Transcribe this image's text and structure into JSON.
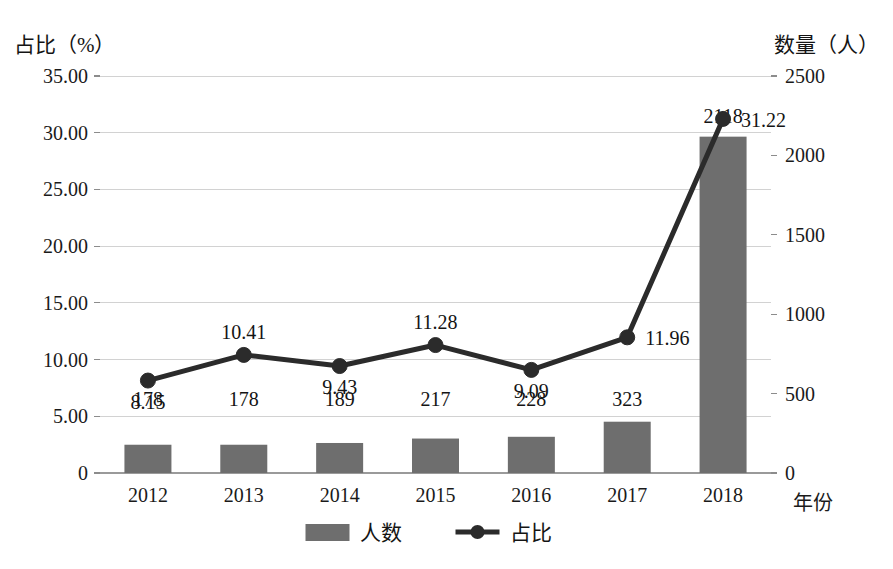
{
  "chart_data": {
    "type": "bar",
    "title": "",
    "subtitle": "",
    "categories": [
      "2012",
      "2013",
      "2014",
      "2015",
      "2016",
      "2017",
      "2018"
    ],
    "xlabel": "年份",
    "series": [
      {
        "name": "人数",
        "type": "bar",
        "axis": "right",
        "unit": "人",
        "values": [
          178,
          178,
          189,
          217,
          228,
          323,
          2118
        ],
        "labels": [
          "178",
          "178",
          "189",
          "217",
          "228",
          "323",
          "2118"
        ],
        "color": "#6e6e6e"
      },
      {
        "name": "占比",
        "type": "line",
        "axis": "left",
        "unit": "%",
        "values": [
          8.15,
          10.41,
          9.43,
          11.28,
          9.09,
          11.96,
          31.22
        ],
        "labels": [
          "8.15",
          "10.41",
          "9.43",
          "11.28",
          "9.09",
          "11.96",
          "31.22"
        ],
        "color": "#2b2b2b"
      }
    ],
    "left_axis": {
      "title": "占比（%）",
      "ylim": [
        0,
        35
      ],
      "ticks": [
        0,
        5,
        10,
        15,
        20,
        25,
        30,
        35
      ],
      "tick_labels": [
        "0",
        "5.00",
        "10.00",
        "15.00",
        "20.00",
        "25.00",
        "30.00",
        "35.00"
      ]
    },
    "right_axis": {
      "title": "数量（人）",
      "ylim": [
        0,
        2500
      ],
      "ticks": [
        0,
        500,
        1000,
        1500,
        2000,
        2500
      ],
      "tick_labels": [
        "0",
        "500",
        "1000",
        "1500",
        "2000",
        "2500"
      ]
    },
    "grid": true,
    "legend": {
      "position": "bottom",
      "entries": [
        {
          "label": "人数",
          "marker": "square",
          "color": "#6e6e6e"
        },
        {
          "label": "占比",
          "marker": "line-dot",
          "color": "#2b2b2b"
        }
      ]
    },
    "label_offsets": {
      "line_label_positions": [
        "below",
        "above",
        "below",
        "above",
        "below",
        "right",
        "right"
      ]
    }
  }
}
